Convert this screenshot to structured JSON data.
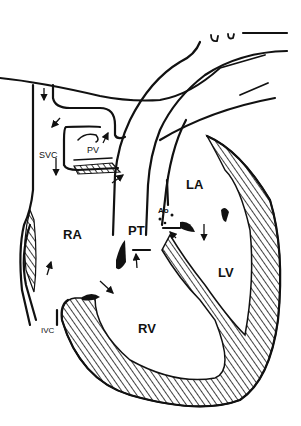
{
  "diagram": {
    "type": "anatomical-line-drawing",
    "colors": {
      "line": "#111111",
      "background": "#ffffff"
    },
    "labels": [
      {
        "id": "svc",
        "text": "SVC"
      },
      {
        "id": "pv",
        "text": "PV"
      },
      {
        "id": "ra",
        "text": "RA"
      },
      {
        "id": "pt",
        "text": "PT"
      },
      {
        "id": "ao",
        "text": "Ao"
      },
      {
        "id": "la",
        "text": "LA"
      },
      {
        "id": "lv",
        "text": "LV"
      },
      {
        "id": "rv",
        "text": "RV"
      },
      {
        "id": "ivc",
        "text": "IVC"
      }
    ]
  }
}
